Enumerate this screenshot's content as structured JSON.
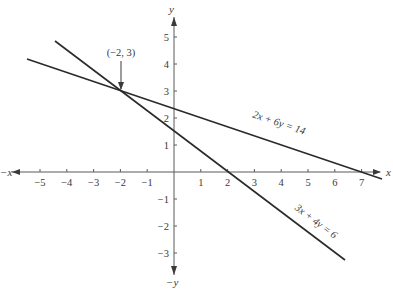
{
  "chart_data": {
    "type": "line",
    "title": "",
    "xlabel": "x",
    "ylabel": "y",
    "xlabel_negative": "−x",
    "ylabel_negative": "−y",
    "xlim": [
      -5.5,
      7.8
    ],
    "ylim": [
      -3.7,
      5.4
    ],
    "grid": false,
    "x_ticks": [
      -5,
      -4,
      -3,
      -2,
      -1,
      1,
      2,
      3,
      4,
      5,
      6,
      7
    ],
    "x_tick_labels": [
      "−5",
      "−4",
      "−3",
      "−2",
      "−1",
      "1",
      "2",
      "3",
      "4",
      "5",
      "6",
      "7"
    ],
    "y_ticks": [
      5,
      4,
      3,
      2,
      1,
      -1,
      -2,
      -3
    ],
    "y_tick_labels": [
      "5",
      "4",
      "3",
      "2",
      "1",
      "−1",
      "−2",
      "−3"
    ],
    "series": [
      {
        "name": "2x + 6y = 14",
        "equation": "2x + 6y = 14",
        "x": [
          -5.49,
          7.76
        ],
        "y": [
          4.16,
          -0.25
        ]
      },
      {
        "name": "3x + 4y = 6",
        "equation": "3x + 4y = 6",
        "x": [
          -4.44,
          6.38
        ],
        "y": [
          4.83,
          -3.29
        ]
      }
    ],
    "annotations": [
      {
        "text": "(−2, 3)",
        "x": -2,
        "y": 3,
        "type": "arrow",
        "note": "intersection point"
      }
    ],
    "legend": "none (inline labels along lines)"
  },
  "labels": {
    "x_pos": "x",
    "x_neg": "−x",
    "y_pos": "y",
    "y_neg": "−y",
    "line1": "2x + 6y = 14",
    "line2": "3x + 4y = 6",
    "intersection": "(−2, 3)"
  },
  "colors": {
    "axis": "#5a5a5a",
    "line": "#2a2a2a",
    "text": "#3a3a3a"
  }
}
